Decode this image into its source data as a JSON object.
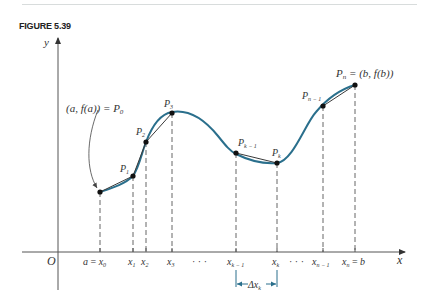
{
  "figure": {
    "label": "FIGURE 5.39"
  },
  "colors": {
    "curve": "#2a6f8c",
    "chord": "#3a3a3a",
    "axis": "#444444",
    "delta_bracket": "#2a6f8c"
  },
  "axes": {
    "x_label": "x",
    "y_label": "y",
    "origin_label": "O"
  },
  "annotations": {
    "start_point": "(a, f(a)) = P",
    "start_point_sub": "0",
    "end_point": "P",
    "end_point_sub": "n",
    "end_point_rest": " = (b, f(b))",
    "delta": "Δx",
    "delta_sub": "k"
  },
  "points": [
    {
      "label": "P",
      "sub": "0",
      "x": 100,
      "y": 192
    },
    {
      "label": "P",
      "sub": "1",
      "x": 133,
      "y": 176
    },
    {
      "label": "P",
      "sub": "2",
      "x": 146,
      "y": 142
    },
    {
      "label": "P",
      "sub": "3",
      "x": 172,
      "y": 113
    },
    {
      "label": "P",
      "sub": "k − 1",
      "x": 236,
      "y": 153
    },
    {
      "label": "P",
      "sub": "k",
      "x": 277,
      "y": 163
    },
    {
      "label": "P",
      "sub": "n − 1",
      "x": 323,
      "y": 106
    },
    {
      "label": "P",
      "sub": "n",
      "x": 355,
      "y": 85
    }
  ],
  "x_ticks": [
    {
      "text": "a = x",
      "sub": "0",
      "x": 100
    },
    {
      "text": "x",
      "sub": "1",
      "x": 133
    },
    {
      "text": "x",
      "sub": "2",
      "x": 146
    },
    {
      "text": "x",
      "sub": "3",
      "x": 172
    },
    {
      "text": "x",
      "sub": "k − 1",
      "x": 236
    },
    {
      "text": "x",
      "sub": "k",
      "x": 277
    },
    {
      "text": "x",
      "sub": "n − 1",
      "x": 323
    },
    {
      "text": "x",
      "sub": "n",
      "rest": " = b",
      "x": 355
    }
  ],
  "ellipsis": "· · ·"
}
